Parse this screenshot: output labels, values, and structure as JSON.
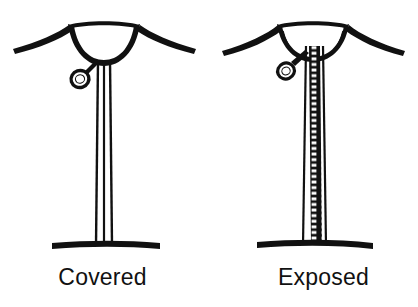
{
  "figure": {
    "type": "line-drawing-comparison",
    "background_color": "#ffffff",
    "ink_color": "#111111",
    "panel_count": 2
  },
  "panels": [
    {
      "id": "covered",
      "label": "Covered",
      "placket_style": "covered-placket",
      "zipper_teeth_visible": false,
      "parts": {
        "neckline": "u-neckline",
        "shoulders": "shoulder-seam-lines",
        "placket": "three-line-vertical-placket",
        "pull": "ring-zipper-pull",
        "hem": "horizontal-hem-line"
      }
    },
    {
      "id": "exposed",
      "label": "Exposed",
      "placket_style": "exposed-zipper",
      "zipper_teeth_visible": true,
      "zipper_teeth_count": 34,
      "parts": {
        "neckline": "u-neckline",
        "shoulders": "shoulder-seam-lines",
        "placket": "exposed-zipper-tape-with-teeth",
        "pull": "ring-zipper-pull",
        "hem": "horizontal-hem-line"
      }
    }
  ],
  "colors": {
    "ink": "#111111",
    "paper": "#ffffff"
  }
}
